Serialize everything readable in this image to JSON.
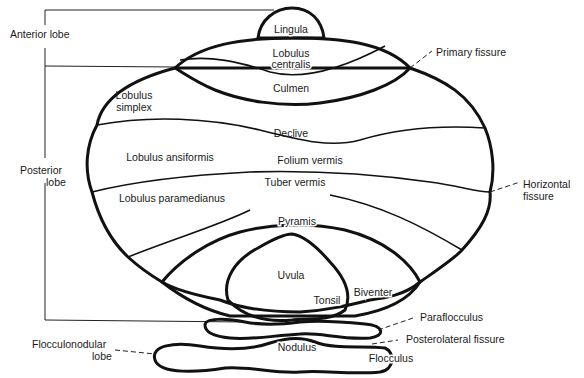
{
  "diagram": {
    "colors": {
      "ink": "#111111",
      "background": "#ffffff"
    },
    "lobes": {
      "anterior": "Anterior lobe",
      "posterior_line1": "Posterior",
      "posterior_line2": "lobe",
      "flocculonodular_line1": "Flocculonodular",
      "flocculonodular_line2": "lobe"
    },
    "regions": {
      "lingula": "Lingula",
      "lobulus_centralis_line1": "Lobulus",
      "lobulus_centralis_line2": "centralis",
      "culmen": "Culmen",
      "lobulus_simplex_line1": "Lobulus",
      "lobulus_simplex_line2": "simplex",
      "declive": "Declive",
      "lobulus_ansiformis": "Lobulus ansiformis",
      "folium_vermis": "Folium vermis",
      "tuber_vermis": "Tuber vermis",
      "lobulus_paramedianus": "Lobulus paramedianus",
      "pyramis": "Pyramis",
      "uvula": "Uvula",
      "tonsil": "Tonsil",
      "biventer": "Biventer",
      "nodulus": "Nodulus",
      "flocculus": "Flocculus"
    },
    "callouts": {
      "primary_fissure": "Primary fissure",
      "horizontal_fissure_line1": "Horizontal",
      "horizontal_fissure_line2": "fissure",
      "paraflocculus": "Paraflocculus",
      "posterolateral_fissure": "Posterolateral fissure"
    }
  }
}
